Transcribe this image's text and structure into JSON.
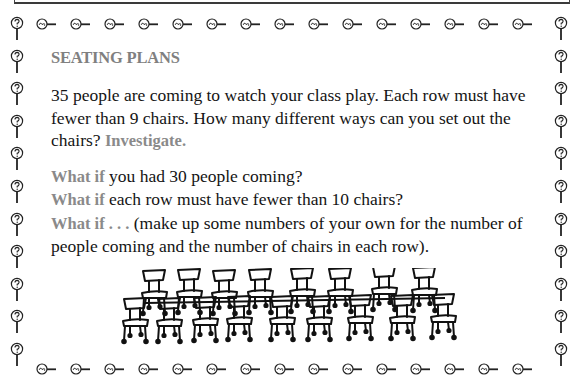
{
  "document": {
    "title": "SEATING PLANS",
    "intro": {
      "text": "35 people are coming to watch your class play. Each row must have fewer than 9 chairs. How many different ways can you set out the chairs?",
      "highlight": "Investigate."
    },
    "what_ifs": [
      {
        "label": "What if",
        "text": "you had 30 people coming?"
      },
      {
        "label": "What if",
        "text": "each row must have fewer than 10 chairs?"
      },
      {
        "label": "What if . . .",
        "text": "(make up some numbers of your own for the number of people coming and the number of chairs in each row)."
      }
    ],
    "illustration": "rows-of-chairs",
    "colors": {
      "accent_gray": "#808080",
      "text": "#141414",
      "border": "#333333"
    }
  },
  "border": {
    "top_icons": 15,
    "bottom_icons": 15,
    "left_icons": 11,
    "right_icons": 11,
    "horizontal_icon": "magnifier-tilde-icon",
    "vertical_icon": "magnifier-question-icon"
  }
}
